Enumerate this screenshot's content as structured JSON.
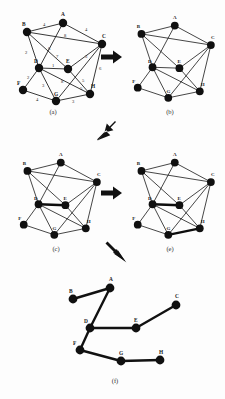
{
  "figure": {
    "node_labels": [
      "A",
      "B",
      "C",
      "D",
      "E",
      "F",
      "G",
      "H"
    ],
    "colors": {
      "ink": "#111111",
      "bold_edge": "#0d0d0d",
      "background": "#ffffff"
    }
  },
  "nodes": {
    "A": {
      "label": "A",
      "x": 57,
      "y": 17
    },
    "B": {
      "label": "B",
      "x": 21,
      "y": 26
    },
    "C": {
      "label": "C",
      "x": 96,
      "y": 38
    },
    "D": {
      "label": "D",
      "x": 33,
      "y": 62
    },
    "E": {
      "label": "E",
      "x": 62,
      "y": 63
    },
    "F": {
      "label": "F",
      "x": 17,
      "y": 84
    },
    "G": {
      "label": "G",
      "x": 50,
      "y": 95
    },
    "H": {
      "label": "H",
      "x": 84,
      "y": 88
    }
  },
  "edges": [
    {
      "from": "B",
      "to": "A",
      "weight": "4"
    },
    {
      "from": "A",
      "to": "C",
      "weight": "4"
    },
    {
      "from": "B",
      "to": "C",
      "weight": "8"
    },
    {
      "from": "B",
      "to": "E",
      "weight": "6"
    },
    {
      "from": "A",
      "to": "D",
      "weight": "7"
    },
    {
      "from": "B",
      "to": "D",
      "weight": "2"
    },
    {
      "from": "D",
      "to": "E",
      "weight": "1"
    },
    {
      "from": "E",
      "to": "C",
      "weight": "3"
    },
    {
      "from": "C",
      "to": "H",
      "weight": "6"
    },
    {
      "from": "C",
      "to": "G",
      "weight": "5"
    },
    {
      "from": "D",
      "to": "F",
      "weight": "2"
    },
    {
      "from": "D",
      "to": "G",
      "weight": "3"
    },
    {
      "from": "D",
      "to": "H",
      "weight": "8"
    },
    {
      "from": "E",
      "to": "H",
      "weight": "5"
    },
    {
      "from": "F",
      "to": "G",
      "weight": "4"
    },
    {
      "from": "G",
      "to": "H",
      "weight": "3"
    }
  ],
  "panels": [
    {
      "id": "a",
      "caption": "(a)",
      "description": "weighted input graph",
      "show_weights": true,
      "bold_edges": []
    },
    {
      "id": "b",
      "caption": "(b)",
      "description": "graph without weights",
      "show_weights": false,
      "bold_edges": []
    },
    {
      "id": "c",
      "caption": "(c)",
      "description": "first edge selected",
      "show_weights": false,
      "bold_edges": [
        "D-E"
      ]
    },
    {
      "id": "e",
      "caption": "(e)",
      "description": "second edge selected",
      "show_weights": false,
      "bold_edges": [
        "D-E",
        "G-H"
      ]
    },
    {
      "id": "f",
      "caption": "(f)",
      "description": "resulting minimum spanning tree",
      "show_weights": false,
      "bold_edges": []
    }
  ],
  "tree": {
    "caption": "(f)",
    "nodes": {
      "A": {
        "label": "A",
        "x": 92,
        "y": 20
      },
      "B": {
        "label": "B",
        "x": 55,
        "y": 31
      },
      "C": {
        "label": "C",
        "x": 158,
        "y": 37
      },
      "D": {
        "label": "D",
        "x": 72,
        "y": 60
      },
      "E": {
        "label": "E",
        "x": 118,
        "y": 60
      },
      "F": {
        "label": "F",
        "x": 62,
        "y": 82
      },
      "G": {
        "label": "G",
        "x": 103,
        "y": 93
      },
      "H": {
        "label": "H",
        "x": 142,
        "y": 92
      }
    },
    "edges": [
      {
        "from": "B",
        "to": "A"
      },
      {
        "from": "A",
        "to": "D"
      },
      {
        "from": "D",
        "to": "E"
      },
      {
        "from": "E",
        "to": "C"
      },
      {
        "from": "D",
        "to": "F"
      },
      {
        "from": "F",
        "to": "G"
      },
      {
        "from": "G",
        "to": "H"
      }
    ]
  },
  "arrows": [
    {
      "name": "arrow-a-to-b",
      "direction": "right",
      "x": 101,
      "y": 56
    },
    {
      "name": "arrow-b-to-c",
      "direction": "down-left",
      "x": 98,
      "y": 122
    },
    {
      "name": "arrow-c-to-e",
      "direction": "right",
      "x": 101,
      "y": 192
    },
    {
      "name": "arrow-e-to-f",
      "direction": "down-right",
      "x": 104,
      "y": 240
    }
  ]
}
